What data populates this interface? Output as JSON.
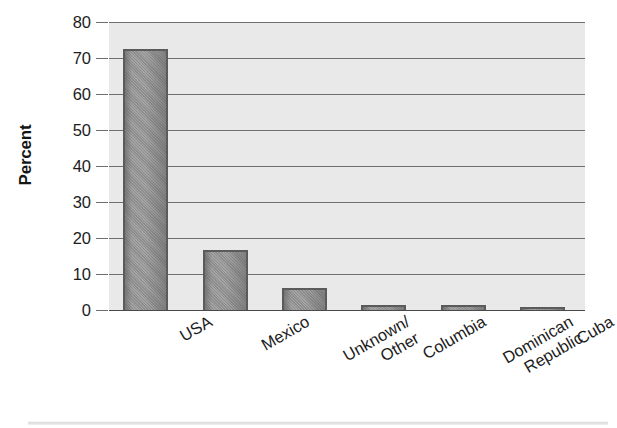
{
  "chart_data": {
    "type": "bar",
    "title": "",
    "subtitle": "",
    "xlabel": "",
    "ylabel": "Percent",
    "ylim": [
      0,
      80
    ],
    "ytick_step": 10,
    "yticks": [
      0,
      10,
      20,
      30,
      40,
      50,
      60,
      70,
      80
    ],
    "ytick_labels": [
      "0",
      "10",
      "20",
      "30",
      "40",
      "50",
      "60",
      "70",
      "80"
    ],
    "categories": [
      "USA",
      "Mexico",
      "Unknown/Other",
      "Columbia",
      "Dominican Republic",
      "Cuba"
    ],
    "category_label_lines": [
      [
        "USA"
      ],
      [
        "Mexico"
      ],
      [
        "Unknown/",
        "Other"
      ],
      [
        "Columbia"
      ],
      [
        "Dominican",
        "Republic"
      ],
      [
        "Cuba"
      ]
    ],
    "values": [
      72.5,
      16.8,
      6.0,
      1.3,
      1.3,
      0.4
    ],
    "grid": true,
    "grid_axis": "y",
    "legend": false,
    "legend_position": "none",
    "xtick_label_rotation": -30,
    "bar_count": 6,
    "annotations": []
  },
  "style": {
    "page_background": "#ffffff",
    "plot_background": "#e9e9e9",
    "gridline_color": "#6e6e6e",
    "axis_line_color": "#4a4a4a",
    "bar_fill_color": "#9a9a9a",
    "bar_border_color": "#5b5b5b",
    "text_color": "#1c1c1c"
  }
}
